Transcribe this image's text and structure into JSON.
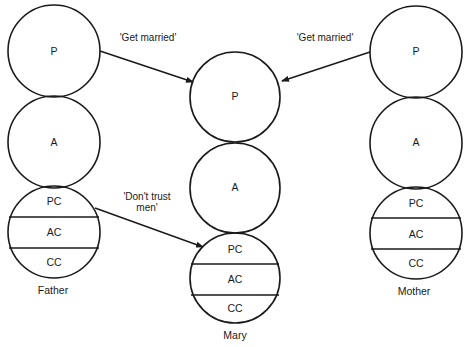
{
  "diagram": {
    "type": "transactional-analysis-ego-states",
    "people": [
      {
        "name": "Father",
        "states": {
          "parent": "P",
          "adult": "A",
          "child": [
            "PC",
            "AC",
            "CC"
          ]
        }
      },
      {
        "name": "Mary",
        "states": {
          "parent": "P",
          "adult": "A",
          "child": [
            "PC",
            "AC",
            "CC"
          ]
        }
      },
      {
        "name": "Mother",
        "states": {
          "parent": "P",
          "adult": "A",
          "child": [
            "PC",
            "AC",
            "CC"
          ]
        }
      }
    ],
    "messages": [
      {
        "from": "Father.P",
        "to": "Mary.P",
        "text": "'Get married'"
      },
      {
        "from": "Mother.P",
        "to": "Mary.P",
        "text": "'Get married'"
      },
      {
        "from": "Father.PC",
        "to": "Mary.PC",
        "text_line1": "'Don't trust",
        "text_line2": "men'"
      }
    ]
  }
}
